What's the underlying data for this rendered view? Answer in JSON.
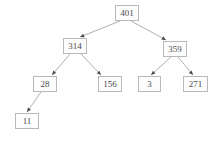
{
  "figure": {
    "kind": "binary-tree-diagram",
    "background_color": "#ffffff",
    "node_border_color": "#b9b9b9",
    "node_fill_color": "#fdfdfd",
    "node_text_color": "#4a4a4a",
    "edge_color": "#9a9a9a",
    "arrowhead_color": "#4a4a4a",
    "width": 219,
    "height": 142
  },
  "nodes": [
    {
      "id": "root",
      "label": "401",
      "x": 115,
      "y": 5,
      "w": 24,
      "h": 16
    },
    {
      "id": "n314",
      "label": "314",
      "x": 63,
      "y": 38,
      "w": 24,
      "h": 16
    },
    {
      "id": "n359",
      "label": "359",
      "x": 163,
      "y": 41,
      "w": 24,
      "h": 16
    },
    {
      "id": "n28",
      "label": "28",
      "x": 33,
      "y": 76,
      "w": 24,
      "h": 16
    },
    {
      "id": "n156",
      "label": "156",
      "x": 98,
      "y": 76,
      "w": 24,
      "h": 16
    },
    {
      "id": "n3",
      "label": "3",
      "x": 138,
      "y": 76,
      "w": 23,
      "h": 16
    },
    {
      "id": "n271",
      "label": "271",
      "x": 183,
      "y": 76,
      "w": 25,
      "h": 16
    },
    {
      "id": "n11",
      "label": "11",
      "x": 15,
      "y": 113,
      "w": 24,
      "h": 16
    }
  ],
  "edges": [
    {
      "from": "root",
      "to": "n314",
      "x1": 120,
      "y1": 21,
      "x2": 80,
      "y2": 37
    },
    {
      "from": "root",
      "to": "n359",
      "x1": 131,
      "y1": 21,
      "x2": 166,
      "y2": 40
    },
    {
      "from": "n314",
      "to": "n28",
      "x1": 70,
      "y1": 54,
      "x2": 52,
      "y2": 75
    },
    {
      "from": "n314",
      "to": "n156",
      "x1": 81,
      "y1": 54,
      "x2": 101,
      "y2": 75
    },
    {
      "from": "n359",
      "to": "n3",
      "x1": 171,
      "y1": 57,
      "x2": 151,
      "y2": 75
    },
    {
      "from": "n359",
      "to": "n271",
      "x1": 178,
      "y1": 57,
      "x2": 193,
      "y2": 75
    },
    {
      "from": "n28",
      "to": "n11",
      "x1": 41,
      "y1": 92,
      "x2": 27,
      "y2": 112
    }
  ]
}
